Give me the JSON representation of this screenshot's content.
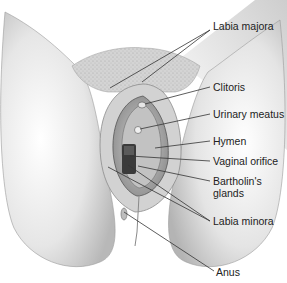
{
  "figure": {
    "labels": [
      {
        "id": "labia-majora",
        "text": "Labia majora",
        "x": 213,
        "y": 26
      },
      {
        "id": "clitoris",
        "text": "Clitoris",
        "x": 213,
        "y": 83
      },
      {
        "id": "urinary-meatus",
        "text": "Urinary meatus",
        "x": 213,
        "y": 110
      },
      {
        "id": "hymen",
        "text": "Hymen",
        "x": 213,
        "y": 137
      },
      {
        "id": "vaginal-orifice",
        "text": "Vaginal orifice",
        "x": 213,
        "y": 157
      },
      {
        "id": "bartholins-glands-line1",
        "text": "Bartholin's",
        "x": 213,
        "y": 177
      },
      {
        "id": "bartholins-glands-line2",
        "text": "glands",
        "x": 213,
        "y": 189
      },
      {
        "id": "labia-minora",
        "text": "Labia minora",
        "x": 213,
        "y": 219
      },
      {
        "id": "anus",
        "text": "Anus",
        "x": 216,
        "y": 270
      }
    ]
  }
}
